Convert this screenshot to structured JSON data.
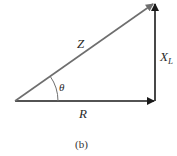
{
  "diagram": {
    "type": "impedance-triangle",
    "caption": "(b)",
    "labels": {
      "hypotenuse": "Z",
      "horizontal": "R",
      "vertical_main": "X",
      "vertical_sub": "L",
      "angle": "θ"
    },
    "colors": {
      "hypotenuse": "#6e6e6e",
      "sides": "#1a1a1a",
      "text": "#2a2a2a"
    }
  }
}
